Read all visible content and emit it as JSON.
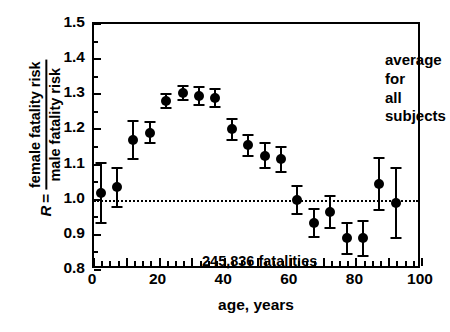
{
  "chart_data": {
    "type": "scatter",
    "title": "",
    "xlabel": "age, years",
    "ylabel_R": "R",
    "ylabel_eq": "=",
    "ylabel_numerator": "female fatality risk",
    "ylabel_denominator": "male fatality risk",
    "xlim": [
      0,
      100
    ],
    "ylim": [
      0.8,
      1.5
    ],
    "xticks": [
      0,
      20,
      40,
      60,
      80,
      100
    ],
    "xtick_labels": [
      "0",
      "20",
      "40",
      "60",
      "80",
      "100"
    ],
    "xminor_step": 2.5,
    "yticks": [
      0.8,
      0.9,
      1.0,
      1.1,
      1.2,
      1.3,
      1.4,
      1.5
    ],
    "ytick_labels": [
      "0.8",
      "0.9",
      "1.0",
      "1.1",
      "1.2",
      "1.3",
      "1.4",
      "1.5"
    ],
    "grid": false,
    "legend": "none",
    "reference_line": {
      "y": 1.0,
      "style": "dotted"
    },
    "x": [
      2,
      7,
      12,
      17,
      22,
      27,
      32,
      37,
      42,
      47,
      52,
      57,
      62,
      67,
      72,
      77,
      82,
      87,
      92
    ],
    "values": [
      1.02,
      1.035,
      1.17,
      1.19,
      1.28,
      1.305,
      1.295,
      1.29,
      1.2,
      1.155,
      1.125,
      1.115,
      1.0,
      0.935,
      0.965,
      0.89,
      0.89,
      1.045,
      0.99
    ],
    "err_low": [
      0.085,
      0.055,
      0.055,
      0.03,
      0.02,
      0.02,
      0.025,
      0.025,
      0.03,
      0.03,
      0.035,
      0.035,
      0.04,
      0.04,
      0.045,
      0.045,
      0.05,
      0.075,
      0.1
    ],
    "err_high": [
      0.085,
      0.055,
      0.055,
      0.03,
      0.02,
      0.02,
      0.025,
      0.025,
      0.03,
      0.03,
      0.035,
      0.035,
      0.04,
      0.04,
      0.045,
      0.045,
      0.05,
      0.075,
      0.1
    ],
    "annotations": [
      {
        "name": "average-for-all-subjects",
        "line1": "average for",
        "line2": "all subjects"
      },
      {
        "name": "fatalities-count",
        "text": "245,836 fatalities"
      }
    ],
    "marker_color": "#000000",
    "axis_color": "#000000",
    "background_color": "#ffffff"
  },
  "annotations": {
    "average_line1": "average for",
    "average_line2": "all subjects",
    "fatalities": "245,836 fatalities"
  }
}
